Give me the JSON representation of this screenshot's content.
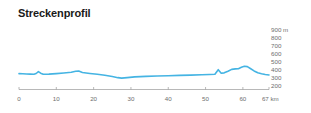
{
  "chart_title": "Streckenprofil",
  "units": {
    "elevation": "m",
    "distance": "km"
  },
  "colors": {
    "line": "#45b4e3",
    "axis": "#9a9a9a",
    "label": "#6e6e6e",
    "title": "#1a1a1a",
    "background": "#ffffff"
  },
  "y_axis": {
    "ticks": [
      {
        "label": "900 m",
        "value": 900
      },
      {
        "label": "800",
        "value": 800
      },
      {
        "label": "700",
        "value": 700
      },
      {
        "label": "600",
        "value": 600
      },
      {
        "label": "500",
        "value": 500
      },
      {
        "label": "400",
        "value": 400
      },
      {
        "label": "300",
        "value": 300
      },
      {
        "label": "200",
        "value": 200
      }
    ]
  },
  "x_axis": {
    "ticks": [
      {
        "label": "0",
        "value": 0
      },
      {
        "label": "10",
        "value": 10
      },
      {
        "label": "20",
        "value": 20
      },
      {
        "label": "30",
        "value": 30
      },
      {
        "label": "40",
        "value": 40
      },
      {
        "label": "50",
        "value": 50
      },
      {
        "label": "60",
        "value": 60
      },
      {
        "label": "67 km",
        "value": 67
      }
    ]
  },
  "chart_data": {
    "type": "area",
    "title": "Streckenprofil",
    "xlabel": "km",
    "ylabel": "m",
    "xlim": [
      0,
      67
    ],
    "ylim": [
      200,
      900
    ],
    "grid": false,
    "legend": null,
    "x": [
      0,
      1,
      2,
      3,
      4,
      4.6,
      5.2,
      5.8,
      6.5,
      8,
      10,
      12,
      14,
      15.2,
      16,
      17,
      19,
      21,
      23,
      25,
      26.5,
      27.5,
      29,
      31,
      34,
      37,
      40,
      43,
      46,
      49,
      51,
      52.5,
      53.4,
      54.2,
      55,
      56,
      57,
      58,
      58.8,
      59.6,
      60.4,
      61.2,
      62,
      63,
      64,
      65,
      66,
      67
    ],
    "y": [
      398,
      396,
      393,
      392,
      390,
      400,
      424,
      404,
      390,
      392,
      398,
      406,
      415,
      428,
      430,
      412,
      400,
      390,
      378,
      362,
      348,
      342,
      348,
      358,
      364,
      368,
      372,
      376,
      380,
      384,
      388,
      390,
      448,
      404,
      408,
      428,
      452,
      458,
      460,
      478,
      490,
      486,
      462,
      432,
      410,
      398,
      388,
      382
    ],
    "series": [
      {
        "name": "Höhenprofil",
        "values": [
          398,
          396,
          393,
          392,
          390,
          400,
          424,
          404,
          390,
          392,
          398,
          406,
          415,
          428,
          430,
          412,
          400,
          390,
          378,
          362,
          348,
          342,
          348,
          358,
          364,
          368,
          372,
          376,
          380,
          384,
          388,
          390,
          448,
          404,
          408,
          428,
          452,
          458,
          460,
          478,
          490,
          486,
          462,
          432,
          410,
          398,
          388,
          382
        ]
      }
    ],
    "annotations": []
  }
}
